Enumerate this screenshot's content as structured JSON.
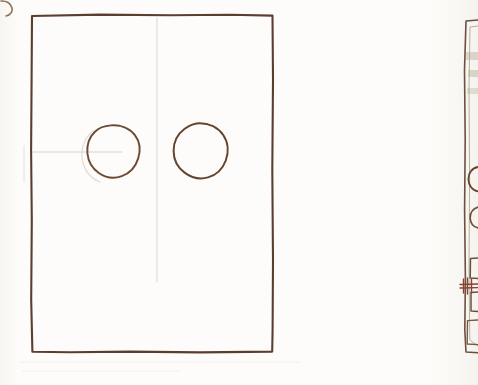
{
  "meta": {
    "kind": "scanned-hand-drawing",
    "width": 478,
    "height": 385
  },
  "colors": {
    "paper": "#fdfcfa",
    "ink_dark": "#5a3f30",
    "ink_mid": "#7a5a44",
    "ink_light": "#9c7c63",
    "ink_faint": "#cfc6bd",
    "ink_accent": "#8a4432"
  },
  "strokes": {
    "main_panel": {
      "name": "main-panel-outline",
      "type": "rectangle",
      "x": 31,
      "y": 15,
      "width": 242,
      "height": 337,
      "stroke_width": 2.1,
      "color": "#5a3f30",
      "path": "M 32 16 L 100 14.6 L 170 15.2 L 230 14.8 L 272.5 15.6 L 273 80 L 272.3 170 L 273 260 L 272.6 330 L 272.2 351.6 L 200 352.4 L 130 351.6 L 70 352.3 L 32.4 351.8 L 31.2 300 L 31.8 220 L 31.1 150 L 31.6 80 Z"
    },
    "circle_left": {
      "name": "circle-opening-left",
      "type": "circle",
      "cx": 113,
      "cy": 151,
      "r": 26,
      "stroke_width": 1.9,
      "color": "#6b4a36",
      "path": "M 111 125.4 C 120.5 124.6 129.6 128.4 134.9 135.2 C 139.9 141.7 140.6 150.6 138.2 158.4 C 135.7 166.6 129.6 173.4 121.8 176.2 C 114.2 178.9 105.4 177.6 98.8 173.0 C 92.3 168.5 88.2 161.2 87.4 153.4 C 86.6 145.4 89.3 137.2 94.9 131.7 C 99.1 127.5 104.9 125.8 111 125.4 Z"
    },
    "circle_right": {
      "name": "circle-opening-right",
      "type": "circle",
      "cx": 200,
      "cy": 150,
      "r": 27,
      "stroke_width": 2.0,
      "color": "#63442f",
      "path": "M 199 123.2 C 208.8 123.0 218.0 127.4 223.2 135.0 C 228.3 142.4 228.9 152.2 225.8 160.5 C 222.7 168.8 216.0 175.2 208.0 177.4 C 200.0 179.6 191.2 177.6 184.6 172.6 C 177.8 167.5 173.6 159.4 173.6 151.0 C 173.6 142.4 177.6 134.0 184.4 129.0 C 188.6 125.8 193.8 123.4 199 123.2 Z"
    },
    "guide_vertical": {
      "name": "construction-line-vertical",
      "type": "line",
      "x1": 157,
      "y1": 18,
      "x2": 157,
      "y2": 282,
      "stroke_width": 1.0,
      "color": "#ddd5cd"
    },
    "guide_horizontal": {
      "name": "construction-line-horizontal",
      "type": "line",
      "x1": 33,
      "y1": 152,
      "x2": 122,
      "y2": 152,
      "stroke_width": 1.0,
      "color": "#d9d1c8"
    },
    "corner_arc": {
      "name": "corner-arc-fragment",
      "type": "arc",
      "path": "M 1 1 C 6 0.5 11 3 12 8 C 12.8 12 10 15.5 6 16",
      "stroke_width": 1.6,
      "color": "#8d7461"
    }
  },
  "right_panel": {
    "name": "adjacent-drawing-fragment",
    "description": "Partially visible second drawing cropped at the right edge of the sheet",
    "outline": {
      "name": "right-panel-outline",
      "path": "M 478 20 L 466 21 L 464.5 70 L 465.2 140 L 464.6 210 L 465.4 280 L 464.8 330 L 466 352 L 478 352.8",
      "stroke_width": 1.6,
      "color": "#6d5340"
    },
    "inner_edge": {
      "name": "right-panel-inner-edge",
      "path": "M 478 26 L 470 27 L 469 90 L 469.6 180 L 469 270 L 469.8 340 L 478 346",
      "stroke_width": 0.9,
      "color": "#b9aa9a"
    },
    "circles": [
      {
        "name": "right-panel-circle-upper",
        "path": "M 478 167 C 472 168 468.4 173 468.4 179 C 468.4 185.4 472.4 190.6 478 191.4",
        "stroke_width": 1.8,
        "color": "#6a4630",
        "cy": 179
      },
      {
        "name": "right-panel-circle-lower",
        "path": "M 478 207 C 473 208.6 470 213 470.2 218.2 C 470.4 223.2 473.6 226.8 478 228",
        "stroke_width": 1.7,
        "color": "#74513a",
        "cy": 218
      }
    ],
    "brackets": [
      {
        "name": "right-panel-bracket-upper",
        "path": "M 478 258 L 470.5 258.4 L 470.2 278 L 478 278.4",
        "stroke_width": 1.5,
        "color": "#6f5140"
      },
      {
        "name": "right-panel-bracket-middle",
        "path": "M 478 292 L 471 292.4 L 471 311 L 478 311.4",
        "stroke_width": 1.5,
        "color": "#6f5140"
      },
      {
        "name": "right-panel-bracket-lower",
        "path": "M 478 320 L 467.5 320.6 L 467.2 344 L 478 344.6",
        "stroke_width": 1.4,
        "color": "#7a5b47"
      }
    ],
    "latch_mark": {
      "name": "right-panel-latch-mark",
      "paths": [
        "M 460 284.5 L 478 284.0",
        "M 460 288.0 L 478 287.6",
        "M 463.5 279 L 463.5 293",
        "M 467.5 278 L 467.5 294",
        "M 471.5 279 L 471.5 293"
      ],
      "stroke_width": 1.4,
      "color": "#8a4432"
    },
    "smudges": [
      {
        "name": "right-panel-smudge-upper",
        "x": 466,
        "y": 52,
        "width": 12,
        "height": 8,
        "color": "#cdbfae",
        "opacity": 0.55
      },
      {
        "name": "right-panel-smudge-mid",
        "x": 468,
        "y": 70,
        "width": 10,
        "height": 7,
        "color": "#c6b7a6",
        "opacity": 0.5
      },
      {
        "name": "right-panel-smudge-low",
        "x": 467,
        "y": 88,
        "width": 11,
        "height": 6,
        "color": "#cfc2b2",
        "opacity": 0.45
      }
    ]
  },
  "ghost_marks": [
    {
      "name": "ghost-arc-behind-left-circle",
      "path": "M 93 131 C 83 139 80 151 83 163 C 85.5 172 92 179 100 182",
      "stroke_width": 1.2,
      "color": "#e2dbd3"
    },
    {
      "name": "ghost-vertical-left",
      "path": "M 24 146 L 24 182",
      "stroke_width": 1.0,
      "color": "#e6e0d9"
    },
    {
      "name": "ghost-baseline",
      "path": "M 20 362 L 300 362",
      "stroke_width": 0.8,
      "color": "#efeae4"
    },
    {
      "name": "ghost-lower-band",
      "path": "M 22 371 L 180 371",
      "stroke_width": 0.8,
      "color": "#f1ece7"
    }
  ]
}
